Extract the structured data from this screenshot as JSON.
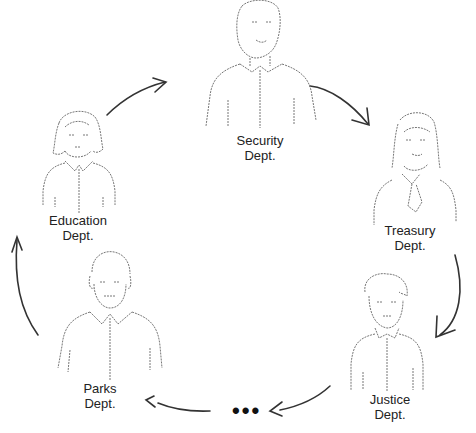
{
  "diagram": {
    "type": "cycle",
    "direction": "clockwise",
    "nodes": [
      {
        "id": "security",
        "line1": "Security",
        "line2": "Dept.",
        "figure": "man-short-hair"
      },
      {
        "id": "treasury",
        "line1": "Treasury",
        "line2": "Dept.",
        "figure": "woman-long-hair-tie"
      },
      {
        "id": "justice",
        "line1": "Justice",
        "line2": "Dept.",
        "figure": "man-curly-hair"
      },
      {
        "id": "parks",
        "line1": "Parks",
        "line2": "Dept.",
        "figure": "man-balding"
      },
      {
        "id": "education",
        "line1": "Education",
        "line2": "Dept.",
        "figure": "woman-bob-hair"
      }
    ],
    "ellipsis": "•••",
    "edges": [
      {
        "from": "education",
        "to": "security"
      },
      {
        "from": "security",
        "to": "treasury"
      },
      {
        "from": "treasury",
        "to": "justice"
      },
      {
        "from": "justice",
        "to": "ellipsis"
      },
      {
        "from": "ellipsis",
        "to": "parks"
      },
      {
        "from": "parks",
        "to": "education"
      }
    ],
    "colors": {
      "line": "#333333",
      "sketch": "#777777",
      "text": "#222222"
    }
  }
}
